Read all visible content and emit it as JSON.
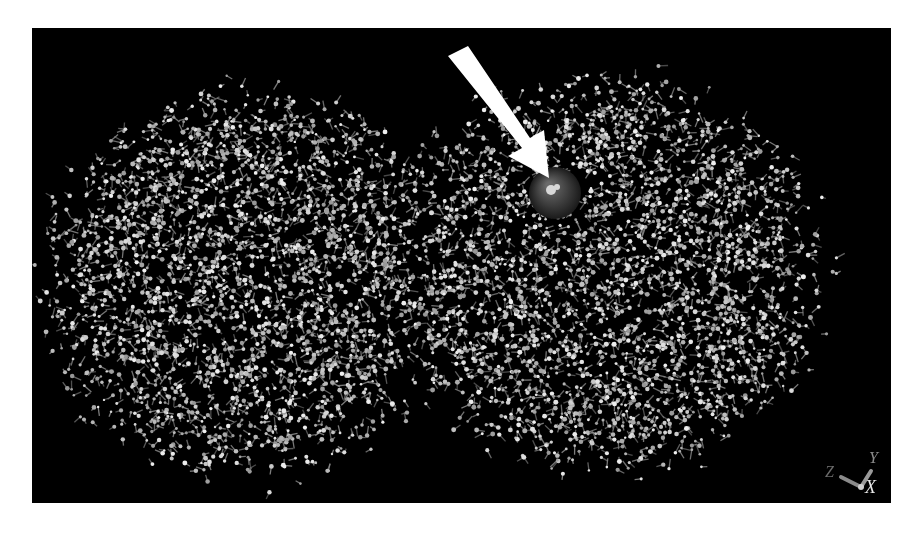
{
  "scene": {
    "description": "Molecular structure ball-and-stick rendering of a two-lobed protein with highlighted ligand sphere",
    "background_color": "#000000",
    "atom_color": "#c8c8c8",
    "bond_color": "#8a8a8a",
    "highlight_sphere_color": "#3a3a3a",
    "arrow_color": "#ffffff"
  },
  "axes": {
    "x_label": "X",
    "y_label": "Y",
    "z_label": "Z"
  },
  "annotation": {
    "arrow_target": "ligand-sphere"
  }
}
